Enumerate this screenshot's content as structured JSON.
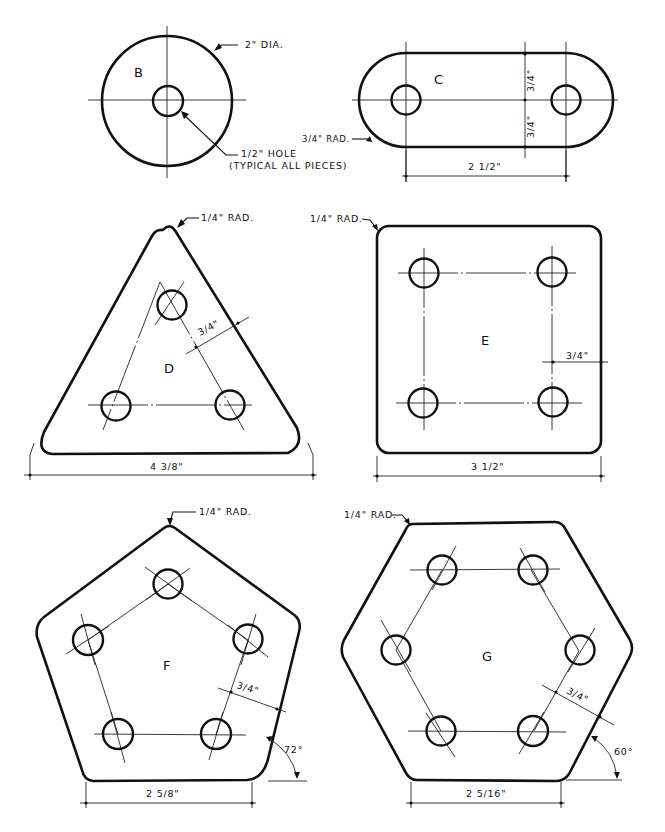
{
  "ink_color": "#111111",
  "paper_color": "#ffffff",
  "pieces": {
    "B": {
      "label": "B",
      "shape": "circle",
      "callouts": {
        "diameter": "2\" DIA.",
        "hole_line1": "1/2\" HOLE",
        "hole_line2": "(TYPICAL ALL PIECES)"
      }
    },
    "C": {
      "label": "C",
      "shape": "slot",
      "callouts": {
        "radius": "3/4\" RAD.",
        "upper_offset": "3/4\"",
        "lower_offset": "3/4\"",
        "hole_spacing": "2 1/2\""
      }
    },
    "D": {
      "label": "D",
      "shape": "triangle",
      "callouts": {
        "radius": "1/4\" RAD.",
        "edge_offset": "3/4\"",
        "width": "4 3/8\""
      }
    },
    "E": {
      "label": "E",
      "shape": "square",
      "callouts": {
        "radius": "1/4\" RAD.",
        "edge_offset": "3/4\"",
        "width": "3 1/2\""
      }
    },
    "F": {
      "label": "F",
      "shape": "pentagon",
      "callouts": {
        "radius": "1/4\" RAD.",
        "edge_offset": "3/4\"",
        "side": "2 5/8\"",
        "angle": "72°"
      }
    },
    "G": {
      "label": "G",
      "shape": "hexagon",
      "callouts": {
        "radius": "1/4\" RAD.",
        "edge_offset": "3/4\"",
        "side": "2 5/16\"",
        "angle": "60°"
      }
    }
  }
}
